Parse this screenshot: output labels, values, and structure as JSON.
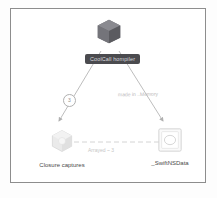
{
  "diagram": {
    "background_color": "#ffffff",
    "frame_border_color": "#8d8d8d",
    "nodes": [
      {
        "id": "root",
        "icon": "cube-3d-icon",
        "icon_style": "dark-filled",
        "label": "CoolCall hompiler",
        "label_style": "dark-pill",
        "label_bg": "#4b4b4f",
        "label_color": "#d9d9dd"
      },
      {
        "id": "closure",
        "icon": "cube-3d-icon",
        "icon_style": "light-outline",
        "label": "Closure captures",
        "label_color": "#4a4a4a"
      },
      {
        "id": "nsdata",
        "icon": "rounded-square-icon",
        "icon_style": "light-outline",
        "label": "_SwiftNSData",
        "label_color": "#4a4a4a"
      }
    ],
    "edges": [
      {
        "id": "root-to-closure",
        "from": "root",
        "to": "closure",
        "style": "solid-arrow",
        "color": "#b5b5b5",
        "badge": "3"
      },
      {
        "id": "root-to-nsdata",
        "from": "root",
        "to": "nsdata",
        "style": "solid-arrow",
        "color": "#b5b5b5",
        "label": "made in ..Memory"
      },
      {
        "id": "closure-to-nsdata",
        "from": "nsdata",
        "to": "closure",
        "style": "dashed-arrow",
        "color": "#c9c9c9",
        "label": "Arrayed ~ 3"
      }
    ]
  }
}
